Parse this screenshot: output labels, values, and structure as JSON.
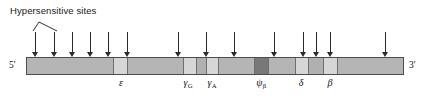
{
  "figure": {
    "type": "gene-locus-map",
    "annotation_label": "Hypersensitive sites",
    "end_labels": {
      "left": "5'",
      "right": "3'"
    },
    "bar": {
      "x": 26,
      "y": 57,
      "width": 378,
      "height": 18,
      "base_color": "#b9b9b9",
      "border_color": "#4d4d4d"
    },
    "segments": [
      {
        "name": "upstream-lcr-region",
        "x": 0,
        "width": 86,
        "color": "#b5b5b5"
      },
      {
        "name": "epsilon-gene",
        "x": 86,
        "width": 15,
        "color": "#d6d6d6"
      },
      {
        "name": "spacer-1",
        "x": 101,
        "width": 55,
        "color": "#b5b5b5"
      },
      {
        "name": "gamma-G-gene",
        "x": 156,
        "width": 14,
        "color": "#d6d6d6"
      },
      {
        "name": "spacer-2",
        "x": 170,
        "width": 9,
        "color": "#b0b0b0"
      },
      {
        "name": "gamma-A-gene",
        "x": 179,
        "width": 13,
        "color": "#d6d6d6"
      },
      {
        "name": "spacer-3",
        "x": 192,
        "width": 35,
        "color": "#b5b5b5"
      },
      {
        "name": "psi-beta-pseudogene",
        "x": 227,
        "width": 15,
        "color": "#787878"
      },
      {
        "name": "spacer-4",
        "x": 242,
        "width": 26,
        "color": "#b5b5b5"
      },
      {
        "name": "delta-gene",
        "x": 268,
        "width": 14,
        "color": "#d6d6d6"
      },
      {
        "name": "spacer-5",
        "x": 282,
        "width": 14,
        "color": "#b0b0b0"
      },
      {
        "name": "beta-gene",
        "x": 296,
        "width": 15,
        "color": "#d6d6d6"
      },
      {
        "name": "downstream-region",
        "x": 311,
        "width": 67,
        "color": "#b5b5b5"
      }
    ],
    "genes": [
      {
        "id": "epsilon",
        "symbol": "ε",
        "sub": "",
        "x": 121
      },
      {
        "id": "gamma-G",
        "symbol": "γ",
        "sub": "G",
        "x": 188
      },
      {
        "id": "gamma-A",
        "symbol": "γ",
        "sub": "A",
        "x": 212
      },
      {
        "id": "psi-beta",
        "symbol": "ψ",
        "sub": "β",
        "x": 261
      },
      {
        "id": "delta",
        "symbol": "δ",
        "sub": "",
        "x": 301
      },
      {
        "id": "beta",
        "symbol": "β",
        "sub": "",
        "x": 330
      }
    ],
    "hypersensitive_sites": [
      {
        "index": 1,
        "x": 35,
        "top": 32
      },
      {
        "index": 2,
        "x": 54,
        "top": 32
      },
      {
        "index": 3,
        "x": 72,
        "top": 32
      },
      {
        "index": 4,
        "x": 90,
        "top": 32
      },
      {
        "index": 5,
        "x": 108,
        "top": 32
      },
      {
        "index": 6,
        "x": 127,
        "top": 32
      },
      {
        "index": 7,
        "x": 178,
        "top": 32
      },
      {
        "index": 8,
        "x": 206,
        "top": 32
      },
      {
        "index": 9,
        "x": 234,
        "top": 32
      },
      {
        "index": 10,
        "x": 274,
        "top": 32
      },
      {
        "index": 11,
        "x": 303,
        "top": 32
      },
      {
        "index": 12,
        "x": 316,
        "top": 32
      },
      {
        "index": 13,
        "x": 330,
        "top": 32
      },
      {
        "index": 14,
        "x": 385,
        "top": 32
      }
    ],
    "leader": {
      "apex_x": 39,
      "apex_y": 22,
      "left_x": 33,
      "left_y": 31,
      "right_x": 57,
      "right_y": 31
    },
    "label_position": {
      "x": 10,
      "y": 5
    },
    "colors": {
      "ink": "#1a1a1a",
      "arrow": "#2a2a2a",
      "gene_light": "#d6d6d6",
      "pseudogene_dark": "#787878",
      "spacer_gray": "#b5b5b5"
    }
  }
}
